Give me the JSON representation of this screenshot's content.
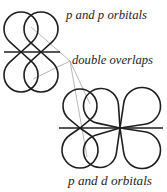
{
  "labels": {
    "p_and_p": "p and p orbitals",
    "double_overlaps": "double overlaps",
    "p_and_d": "p and d orbitals"
  },
  "colors": {
    "outline": "#1e1e1e",
    "leader": "#9a9a9a",
    "background": "#ffffff"
  },
  "diagrams": [
    {
      "name": "p-and-p-orbitals-diagram",
      "axis": {
        "x1": 4,
        "x2": 60,
        "y": 52
      },
      "orbitals": [
        {
          "name": "p-orbital-left",
          "type": "p",
          "node": [
            21,
            52
          ],
          "lobes": [
            {
              "c": [
                21,
                29
              ],
              "r": 17
            },
            {
              "c": [
                21,
                75
              ],
              "r": 17
            }
          ]
        },
        {
          "name": "p-orbital-right",
          "type": "p",
          "node": [
            41,
            52
          ],
          "lobes": [
            {
              "c": [
                41,
                29
              ],
              "r": 17
            },
            {
              "c": [
                41,
                75
              ],
              "r": 17
            }
          ]
        }
      ]
    },
    {
      "name": "p-and-d-orbitals-diagram",
      "axis": {
        "x1": 59,
        "x2": 163,
        "y": 128
      },
      "orbitals": [
        {
          "name": "p-orbital",
          "type": "p",
          "node": [
            80,
            128
          ],
          "lobes": [
            {
              "c": [
                80,
                106
              ],
              "r": 17
            },
            {
              "c": [
                80,
                150
              ],
              "r": 18
            }
          ]
        },
        {
          "name": "d-orbital",
          "type": "d",
          "node": [
            120,
            128
          ],
          "lobes": [
            {
              "c": [
                142,
                106
              ],
              "r": 18.5
            },
            {
              "c": [
                142,
                150
              ],
              "r": 18.5
            },
            {
              "c": [
                101,
                106
              ],
              "r": 17.5
            },
            {
              "c": [
                100,
                151
              ],
              "r": 16.5
            }
          ]
        }
      ]
    }
  ],
  "leaders": {
    "origin": [
      70,
      61
    ],
    "targets": [
      [
        31,
        27
      ],
      [
        33,
        79
      ],
      [
        90,
        104
      ],
      [
        87,
        157
      ]
    ]
  }
}
